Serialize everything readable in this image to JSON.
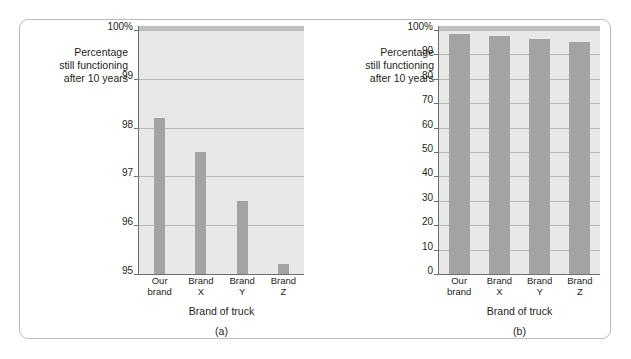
{
  "figure": {
    "panels": [
      {
        "id": "a",
        "caption": "(a)",
        "y_caption_lines": [
          "Percentage",
          "still functioning",
          "after 10 years"
        ],
        "x_axis_title": "Brand of truck"
      },
      {
        "id": "b",
        "caption": "(b)",
        "y_caption_lines": [
          "Percentage",
          "still functioning",
          "after 10 years"
        ],
        "x_axis_title": "Brand of truck"
      }
    ]
  },
  "chart_data": [
    {
      "type": "bar",
      "panel": "a",
      "title": "",
      "xlabel": "Brand of truck",
      "ylabel": "Percentage still functioning after 10 years",
      "categories": [
        "Our brand",
        "Brand X",
        "Brand Y",
        "Brand Z"
      ],
      "category_lines": [
        [
          "Our",
          "brand"
        ],
        [
          "Brand",
          "X"
        ],
        [
          "Brand",
          "Y"
        ],
        [
          "Brand",
          "Z"
        ]
      ],
      "values": [
        98.2,
        97.5,
        96.5,
        95.2
      ],
      "ylim": [
        95,
        100
      ],
      "yticks": [
        95,
        96,
        97,
        98,
        99,
        100
      ],
      "ytick_labels": [
        "95",
        "96",
        "97",
        "98",
        "99",
        "100%"
      ],
      "grid": true,
      "legend": "none",
      "bar_color": "#a2a4a2",
      "plot_background": "#e8e8e6"
    },
    {
      "type": "bar",
      "panel": "b",
      "title": "",
      "xlabel": "Brand of truck",
      "ylabel": "Percentage still functioning after 10 years",
      "categories": [
        "Our brand",
        "Brand X",
        "Brand Y",
        "Brand Z"
      ],
      "category_lines": [
        [
          "Our",
          "brand"
        ],
        [
          "Brand",
          "X"
        ],
        [
          "Brand",
          "Y"
        ],
        [
          "Brand",
          "Z"
        ]
      ],
      "values": [
        98.2,
        97.5,
        96.5,
        95.2
      ],
      "ylim": [
        0,
        100
      ],
      "yticks": [
        0,
        10,
        20,
        30,
        40,
        50,
        60,
        70,
        80,
        90,
        100
      ],
      "ytick_labels": [
        "0",
        "10",
        "20",
        "30",
        "40",
        "50",
        "60",
        "70",
        "80",
        "90",
        "100%"
      ],
      "grid": true,
      "legend": "none",
      "bar_color": "#a2a4a2",
      "plot_background": "#e8e8e6"
    }
  ]
}
